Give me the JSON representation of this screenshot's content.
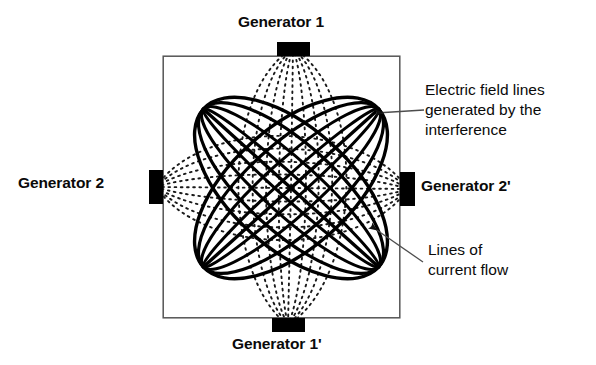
{
  "diagram": {
    "box": {
      "x": 163,
      "y": 56,
      "width": 237,
      "height": 262,
      "stroke": "#555555",
      "stroke_width": 1.4
    },
    "center": {
      "x": 291,
      "y": 188
    },
    "colors": {
      "electrode": "#000000",
      "current_lines": "#000000",
      "field_lines": "#1a1a1a",
      "box_border": "#555555",
      "text": "#0a0a0a",
      "leader": "#4d4d4d",
      "background": "#ffffff"
    },
    "electrodes": [
      {
        "name": "generator-1-electrode",
        "x": 277,
        "y": 42,
        "width": 33,
        "height": 14
      },
      {
        "name": "generator-1-prime-electrode",
        "x": 272,
        "y": 318,
        "width": 33,
        "height": 14
      },
      {
        "name": "generator-2-electrode",
        "x": 149,
        "y": 170,
        "width": 14,
        "height": 34
      },
      {
        "name": "generator-2-prime-electrode",
        "x": 400,
        "y": 172,
        "width": 15,
        "height": 34
      }
    ],
    "labels": {
      "generator_1": "Generator 1",
      "generator_1_prime": "Generator 1'",
      "generator_2": "Generator 2",
      "generator_2_prime": "Generator 2'"
    },
    "annotations": {
      "field_lines": {
        "line1": "Electric field lines",
        "line2": "generated by the",
        "line3": "interference",
        "arrow_from": {
          "x": 424,
          "y": 110
        },
        "arrow_to": {
          "x": 374,
          "y": 113
        }
      },
      "current_lines": {
        "line1": "Lines of",
        "line2": "current flow",
        "arrow_from": {
          "x": 423,
          "y": 262
        },
        "arrow_to": {
          "x": 369,
          "y": 224
        }
      }
    },
    "current_flow": {
      "description": "Two nested families of lens-shaped loops along the two diagonals",
      "family_a_angle_deg": -42,
      "family_b_angle_deg": 42,
      "semi_major": 118,
      "widths": [
        11,
        27,
        44,
        60
      ],
      "stroke_width": 3.2
    },
    "field_lines": {
      "description": "Dotted arcs bulging between each opposing generator pair",
      "vertical_pair": "Generator 1 to Generator 1'",
      "horizontal_pair": "Generator 2 to Generator 2'",
      "bulges": [
        0,
        17,
        34,
        52,
        70
      ],
      "dash": "1.6 4.4",
      "stroke_width": 1.8
    }
  }
}
